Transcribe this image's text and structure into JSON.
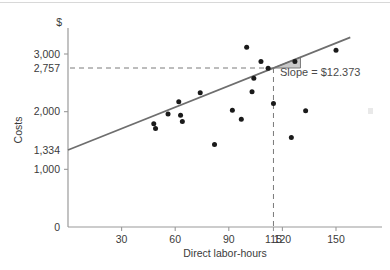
{
  "chart_data": {
    "type": "scatter",
    "title": "",
    "xlabel": "Direct labor-hours",
    "ylabel": "Costs",
    "y_unit_symbol": "$",
    "xlim": [
      0,
      165
    ],
    "ylim": [
      0,
      3300
    ],
    "grid": false,
    "legend": false,
    "xticks": [
      {
        "value": 30,
        "label": "30"
      },
      {
        "value": 60,
        "label": "60"
      },
      {
        "value": 90,
        "label": "90"
      },
      {
        "value": 115,
        "label": "115"
      },
      {
        "value": 120,
        "label": "120"
      },
      {
        "value": 150,
        "label": "150"
      }
    ],
    "yticks": [
      {
        "value": 0,
        "label": "0"
      },
      {
        "value": 1000,
        "label": "1,000"
      },
      {
        "value": 1334,
        "label": "1,334"
      },
      {
        "value": 2000,
        "label": "2,000"
      },
      {
        "value": 2757,
        "label": "2,757"
      },
      {
        "value": 3000,
        "label": "3,000"
      }
    ],
    "points": [
      {
        "x": 48,
        "y": 1790
      },
      {
        "x": 49,
        "y": 1710
      },
      {
        "x": 56,
        "y": 1960
      },
      {
        "x": 62,
        "y": 2170
      },
      {
        "x": 63,
        "y": 1940
      },
      {
        "x": 64,
        "y": 1830
      },
      {
        "x": 74,
        "y": 2330
      },
      {
        "x": 82,
        "y": 1430
      },
      {
        "x": 92,
        "y": 2025
      },
      {
        "x": 97,
        "y": 1870
      },
      {
        "x": 100,
        "y": 3115
      },
      {
        "x": 103,
        "y": 2345
      },
      {
        "x": 104,
        "y": 2580
      },
      {
        "x": 108,
        "y": 2870
      },
      {
        "x": 112,
        "y": 2755
      },
      {
        "x": 115,
        "y": 2140
      },
      {
        "x": 125,
        "y": 1550
      },
      {
        "x": 127,
        "y": 2870
      },
      {
        "x": 133,
        "y": 2015
      },
      {
        "x": 150,
        "y": 3065
      }
    ],
    "regression_line": {
      "slope": 12.373,
      "intercept": 1334,
      "anchor_x": 115,
      "anchor_y": 2757,
      "color": "#6e6e6e"
    },
    "annotations": {
      "slope_label": "Slope  =  $12.373",
      "slope_triangle_fill": "#c9c9c9",
      "dropline_x_value": 115,
      "dropline_y_value": 2757,
      "dropline_color": "#7a7a7a"
    },
    "style": {
      "point_color": "#1a1a1a",
      "axis_color": "#9a9a9a",
      "text_color": "#3a3a3a",
      "background": "#ffffff"
    }
  }
}
